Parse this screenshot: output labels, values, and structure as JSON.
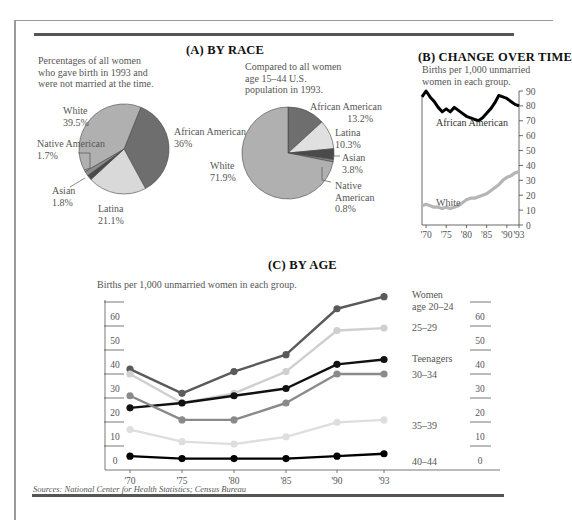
{
  "panels": {
    "a": {
      "title": "(A) BY RACE",
      "left_note": "Percentages of all women who gave birth in 1993 and were not married at the time.",
      "right_note": "Compared to all women age 15–44 U.S. population in 1993."
    },
    "b": {
      "title": "(B) CHANGE OVER TIME",
      "note": "Births per 1,000 unmarried women in each group."
    },
    "c": {
      "title": "(C) BY AGE",
      "note": "Births per 1,000 unmarried women in each group."
    }
  },
  "sources": "Sources: National Center for Health Statistics; Census Bureau",
  "chart_data": [
    {
      "type": "pie",
      "title": "(A) BY RACE — unmarried women who gave birth in 1993",
      "slices": [
        {
          "label": "African American",
          "value": 36.0,
          "display": "36%",
          "color": "#6e6e6e"
        },
        {
          "label": "Latina",
          "value": 21.1,
          "display": "21.1%",
          "color": "#d9d9d9"
        },
        {
          "label": "Asian",
          "value": 1.8,
          "display": "1.8%",
          "color": "#4a4a4a"
        },
        {
          "label": "Native American",
          "value": 1.7,
          "display": "1.7%",
          "color": "#8c8c8c"
        },
        {
          "label": "White",
          "value": 39.5,
          "display": "39.5%",
          "color": "#b0b0b0"
        }
      ]
    },
    {
      "type": "pie",
      "title": "(A) BY RACE — all women age 15–44 U.S. population 1993",
      "slices": [
        {
          "label": "African American",
          "value": 13.2,
          "display": "13.2%",
          "color": "#6e6e6e"
        },
        {
          "label": "Latina",
          "value": 10.3,
          "display": "10.3%",
          "color": "#e0e0e0"
        },
        {
          "label": "Asian",
          "value": 3.8,
          "display": "3.8%",
          "color": "#4a4a4a"
        },
        {
          "label": "Native American",
          "value": 0.8,
          "display": "0.8%",
          "color": "#8c8c8c"
        },
        {
          "label": "White",
          "value": 71.9,
          "display": "71.9%",
          "color": "#b0b0b0"
        }
      ]
    },
    {
      "type": "line",
      "title": "(B) CHANGE OVER TIME",
      "ylabel": "Births per 1,000 unmarried women in each group.",
      "x": [
        1969,
        1970,
        1971,
        1972,
        1973,
        1974,
        1975,
        1976,
        1977,
        1978,
        1979,
        1980,
        1981,
        1982,
        1983,
        1984,
        1985,
        1986,
        1987,
        1988,
        1989,
        1990,
        1991,
        1992,
        1993
      ],
      "xticks": [
        "'70",
        "'75",
        "'80",
        "'85",
        "'90",
        "'93"
      ],
      "yticks": [
        0,
        10,
        20,
        30,
        40,
        50,
        60,
        70,
        80,
        90
      ],
      "ylim": [
        0,
        90
      ],
      "axis_position": "right",
      "series": [
        {
          "name": "African American",
          "color": "#000000",
          "values": [
            86,
            90,
            86,
            83,
            79,
            76,
            78,
            76,
            79,
            77,
            75,
            73,
            72,
            71,
            70,
            72,
            75,
            78,
            82,
            87,
            86,
            85,
            83,
            81,
            80
          ]
        },
        {
          "name": "White",
          "color": "#b5b5b5",
          "values": [
            13,
            14,
            13,
            12,
            12,
            11,
            12,
            11,
            12,
            13,
            15,
            17,
            18,
            18,
            19,
            20,
            21,
            23,
            25,
            27,
            30,
            32,
            33,
            35,
            36
          ]
        }
      ]
    },
    {
      "type": "line",
      "title": "(C) BY AGE",
      "ylabel": "Births per 1,000 unmarried women in each group.",
      "categories": [
        "'70",
        "'75",
        "'80",
        "'85",
        "'90",
        "'93"
      ],
      "yticks": [
        0,
        10,
        20,
        30,
        40,
        50,
        60
      ],
      "ylim": [
        0,
        70
      ],
      "grid": false,
      "series": [
        {
          "name": "Women age 20–24",
          "label_line1": "Women",
          "label_line2": "age 20–24",
          "color": "#5a5a5a",
          "values": [
            38,
            28,
            37,
            44,
            63,
            68
          ]
        },
        {
          "name": "25–29",
          "color": "#cfcfcf",
          "values": [
            36,
            24,
            28,
            37,
            54,
            55
          ]
        },
        {
          "name": "Teenagers",
          "color": "#111111",
          "values": [
            22,
            24,
            27,
            30,
            40,
            42
          ]
        },
        {
          "name": "30–34",
          "color": "#8a8a8a",
          "values": [
            27,
            17,
            17,
            24,
            36,
            36
          ]
        },
        {
          "name": "35–39",
          "color": "#dedede",
          "values": [
            13,
            8,
            7,
            10,
            16,
            17
          ]
        },
        {
          "name": "40–44",
          "color": "#000000",
          "values": [
            2,
            1,
            1,
            1,
            2,
            3
          ]
        }
      ]
    }
  ]
}
